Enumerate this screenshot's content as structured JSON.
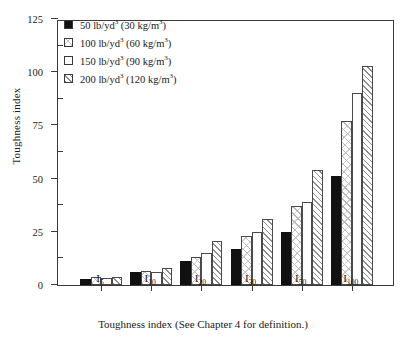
{
  "chart_data": {
    "type": "bar",
    "title": "",
    "xlabel": "Toughness index (See Chapter 4 for definition.)",
    "ylabel": "Toughness index",
    "categories": [
      "I5",
      "I10",
      "I20",
      "I30",
      "I50",
      "I100"
    ],
    "category_labels": [
      {
        "base": "I",
        "sub": "5"
      },
      {
        "base": "I",
        "sub": "10"
      },
      {
        "base": "I",
        "sub": "20"
      },
      {
        "base": "I",
        "sub": "30"
      },
      {
        "base": "I",
        "sub": "50"
      },
      {
        "base": "I",
        "sub": "100"
      }
    ],
    "ylim": [
      0,
      125
    ],
    "yticks": [
      0,
      25,
      50,
      75,
      100,
      125
    ],
    "ytick_labels": [
      "0",
      "25",
      "50",
      "75",
      "100",
      "125"
    ],
    "yminor_ticks": [
      12.5,
      37.5,
      62.5,
      87.5,
      112.5
    ],
    "grid": false,
    "legend_position": "top-left",
    "series": [
      {
        "name": "50 lb/yd3 (30 kg/m3)",
        "label_main": "50 lb/yd",
        "label_main_sup": "3",
        "label_paren_open": " (30 kg/m",
        "label_paren_sup": "3",
        "label_paren_close": ")",
        "pattern": "solid-black",
        "values": [
          3,
          6,
          11.5,
          17,
          25,
          51
        ]
      },
      {
        "name": "100 lb/yd3 (60 kg/m3)",
        "label_main": "100 lb/yd",
        "label_main_sup": "3",
        "label_paren_open": " (60 kg/m",
        "label_paren_sup": "3",
        "label_paren_close": ")",
        "pattern": "light-cross-hatch",
        "values": [
          4,
          6.5,
          13,
          23,
          37,
          77
        ]
      },
      {
        "name": "150 lb/yd3 (90 kg/m3)",
        "label_main": "150 lb/yd",
        "label_main_sup": "3",
        "label_paren_open": " (90 kg/m",
        "label_paren_sup": "3",
        "label_paren_close": ")",
        "pattern": "white-empty",
        "values": [
          3.5,
          6,
          15,
          25,
          39,
          90
        ]
      },
      {
        "name": "200 lb/yd3 (120 kg/m3)",
        "label_main": "200 lb/yd",
        "label_main_sup": "3",
        "label_paren_open": " (120 kg/m",
        "label_paren_sup": "3",
        "label_paren_close": ")",
        "pattern": "diagonal-hatch",
        "values": [
          4,
          8,
          20.5,
          31,
          54,
          103
        ]
      }
    ]
  },
  "axis": {
    "y_title": "Toughness index",
    "x_caption": "Toughness index (See Chapter 4 for definition.)"
  },
  "colors": {
    "axis": "#3a3a3a",
    "bar_solid": "#111111",
    "bar_outline": "#4a4a4a",
    "background": "#ffffff"
  }
}
